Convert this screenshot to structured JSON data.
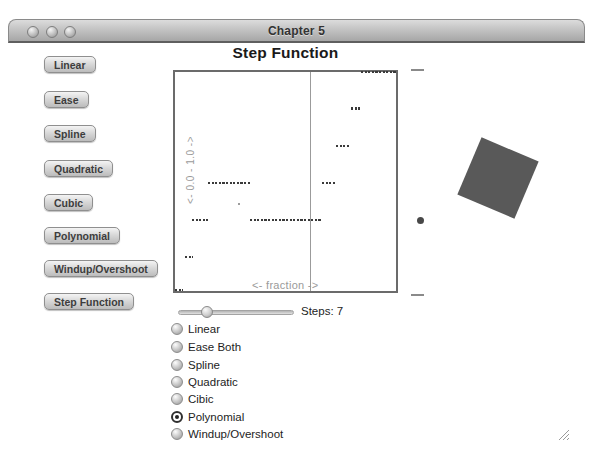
{
  "window": {
    "title": "Chapter 5",
    "traffic_lights": [
      "close",
      "minimize",
      "zoom"
    ]
  },
  "sidebar": {
    "buttons": [
      {
        "label": "Linear"
      },
      {
        "label": "Ease"
      },
      {
        "label": "Spline"
      },
      {
        "label": "Quadratic"
      },
      {
        "label": "Cubic"
      },
      {
        "label": "Polynomial"
      },
      {
        "label": "Windup/Overshoot"
      },
      {
        "label": "Step Function"
      }
    ]
  },
  "chart_data": {
    "type": "scatter",
    "title": "Step Function",
    "xlabel": "<- fraction ->",
    "ylabel": "<- 0.0 - 1.0 ->",
    "xlim": [
      0,
      1
    ],
    "ylim": [
      0,
      1
    ],
    "grid": false,
    "steps": 7,
    "easing": "Polynomial",
    "cursor_x": 0.609,
    "dot_color": "#3a3a3a",
    "levels": [
      0,
      0.157,
      0.323,
      0.493,
      0.664,
      0.834,
      1.0
    ],
    "segments": [
      {
        "y": 1.0,
        "x0": 0.84,
        "x1": 1.0
      },
      {
        "y": 0.834,
        "x0": 0.796,
        "x1": 0.836
      },
      {
        "y": 0.664,
        "x0": 0.729,
        "x1": 0.791
      },
      {
        "y": 0.493,
        "x0": 0.151,
        "x1": 0.342
      },
      {
        "y": 0.493,
        "x0": 0.667,
        "x1": 0.722
      },
      {
        "y": 0.323,
        "x0": 0.076,
        "x1": 0.151
      },
      {
        "y": 0.323,
        "x0": 0.338,
        "x1": 0.662
      },
      {
        "y": 0.157,
        "x0": 0.044,
        "x1": 0.08
      },
      {
        "y": 0.004,
        "x0": 0.0,
        "x1": 0.036
      }
    ],
    "stray_point": {
      "x": 0.285,
      "y": 0.402
    }
  },
  "stage": {
    "square": {
      "color": "#595959",
      "rotation_deg": 23
    },
    "ball": {
      "color": "#484848"
    },
    "tick_top": "track-tick",
    "tick_bottom": "track-tick"
  },
  "controls": {
    "slider": {
      "label": "Steps: 7",
      "value": 7,
      "knob_fraction": 0.25
    },
    "radios": [
      {
        "label": "Linear",
        "selected": false
      },
      {
        "label": "Ease Both",
        "selected": false
      },
      {
        "label": "Spline",
        "selected": false
      },
      {
        "label": "Quadratic",
        "selected": false
      },
      {
        "label": "Cibic",
        "selected": false
      },
      {
        "label": "Polynomial",
        "selected": true
      },
      {
        "label": "Windup/Overshoot",
        "selected": false
      }
    ]
  },
  "colors": {
    "titlebar_top": "#dcdcdc",
    "titlebar_bottom": "#a6a6a6",
    "plot_border": "#6b6b6b",
    "axis_label": "#9a9a9a"
  }
}
